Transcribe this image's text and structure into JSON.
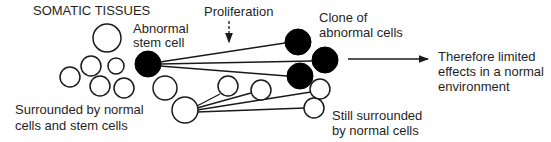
{
  "title": "SOMATIC TISSUES",
  "labels": {
    "abnormal_stem_cell": [
      "Abnormal",
      "stem cell"
    ],
    "proliferation": "Proliferation",
    "clone": [
      "Clone of",
      "abnormal cells"
    ],
    "therefore": [
      "Therefore limited",
      "effects in a normal",
      "environment"
    ],
    "surrounded": [
      "Surrounded by normal",
      "cells and stem cells"
    ],
    "still_surrounded": [
      "Still surrounded",
      "by normal cells"
    ]
  },
  "colors": {
    "stroke": "#1a1a1a",
    "abnormal_fill": "#000000",
    "normal_fill": "#ffffff"
  }
}
